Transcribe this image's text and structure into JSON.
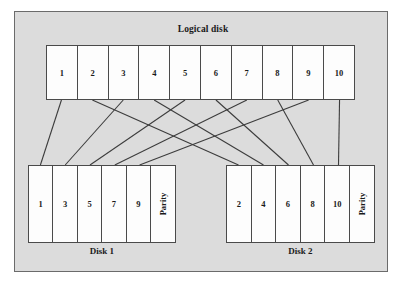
{
  "figure": {
    "background_color": "#dcdcdc",
    "border_color": "#6b6b6b",
    "block_border_color": "#4a4a4a",
    "block_fill_color": "#fdfdfd",
    "line_color": "#3c3c3c",
    "width": 406,
    "height": 290
  },
  "logical": {
    "title": "Logical disk",
    "blocks": [
      {
        "label": "1"
      },
      {
        "label": "2"
      },
      {
        "label": "3"
      },
      {
        "label": "4"
      },
      {
        "label": "5"
      },
      {
        "label": "6"
      },
      {
        "label": "7"
      },
      {
        "label": "8"
      },
      {
        "label": "9"
      },
      {
        "label": "10"
      }
    ]
  },
  "disks": [
    {
      "caption": "Disk 1",
      "blocks": [
        {
          "label": "1",
          "kind": "data"
        },
        {
          "label": "3",
          "kind": "data"
        },
        {
          "label": "5",
          "kind": "data"
        },
        {
          "label": "7",
          "kind": "data"
        },
        {
          "label": "9",
          "kind": "data"
        },
        {
          "label": "Parity",
          "kind": "parity"
        }
      ]
    },
    {
      "caption": "Disk 2",
      "blocks": [
        {
          "label": "2",
          "kind": "data"
        },
        {
          "label": "4",
          "kind": "data"
        },
        {
          "label": "6",
          "kind": "data"
        },
        {
          "label": "8",
          "kind": "data"
        },
        {
          "label": "10",
          "kind": "data"
        },
        {
          "label": "Parity",
          "kind": "parity"
        }
      ]
    }
  ],
  "chart_data": {
    "type": "diagram",
    "title": "Logical disk",
    "mappings": [
      {
        "logical_block": "1",
        "target_disk": "Disk 1",
        "target_slot": 0
      },
      {
        "logical_block": "2",
        "target_disk": "Disk 2",
        "target_slot": 0
      },
      {
        "logical_block": "3",
        "target_disk": "Disk 1",
        "target_slot": 1
      },
      {
        "logical_block": "4",
        "target_disk": "Disk 2",
        "target_slot": 1
      },
      {
        "logical_block": "5",
        "target_disk": "Disk 1",
        "target_slot": 2
      },
      {
        "logical_block": "6",
        "target_disk": "Disk 2",
        "target_slot": 2
      },
      {
        "logical_block": "7",
        "target_disk": "Disk 1",
        "target_slot": 3
      },
      {
        "logical_block": "8",
        "target_disk": "Disk 2",
        "target_slot": 3
      },
      {
        "logical_block": "9",
        "target_disk": "Disk 1",
        "target_slot": 4
      },
      {
        "logical_block": "10",
        "target_disk": "Disk 2",
        "target_slot": 4
      }
    ]
  }
}
